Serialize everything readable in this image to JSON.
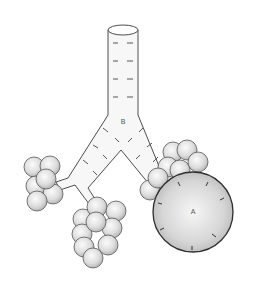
{
  "figure": {
    "labels": {
      "airway_junction": "B",
      "enlarged_alveolus": "A"
    }
  },
  "colors": {
    "stroke": "#3a3a3a",
    "tube_fill": "#f7f7f7",
    "alveolus_light": "#fafafa",
    "alveolus_dark": "#b5b5b5",
    "label": "#555555"
  }
}
